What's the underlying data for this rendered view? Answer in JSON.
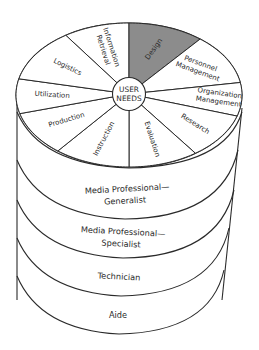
{
  "diagram": {
    "center_label": [
      "USER",
      "NEEDS"
    ],
    "highlight_color": "#8c8c8c",
    "segments": [
      {
        "label": [
          "Information",
          "Retrieval"
        ],
        "highlighted": false
      },
      {
        "label": [
          "Design"
        ],
        "highlighted": true
      },
      {
        "label": [
          "Personnel",
          "Management"
        ],
        "highlighted": false
      },
      {
        "label": [
          "Organization",
          "Management"
        ],
        "highlighted": false
      },
      {
        "label": [
          "Research"
        ],
        "highlighted": false
      },
      {
        "label": [
          "Evaluation"
        ],
        "highlighted": false
      },
      {
        "label": [
          "Instruction"
        ],
        "highlighted": false
      },
      {
        "label": [
          "Production"
        ],
        "highlighted": false
      },
      {
        "label": [
          "Utilization"
        ],
        "highlighted": false
      },
      {
        "label": [
          "Logistics"
        ],
        "highlighted": false
      }
    ],
    "layers": [
      {
        "label": [
          "Media Professional—",
          "Generalist"
        ]
      },
      {
        "label": [
          "Media Professional—",
          "Specialist"
        ]
      },
      {
        "label": [
          "Technician"
        ]
      },
      {
        "label": [
          "Aide"
        ]
      }
    ]
  }
}
